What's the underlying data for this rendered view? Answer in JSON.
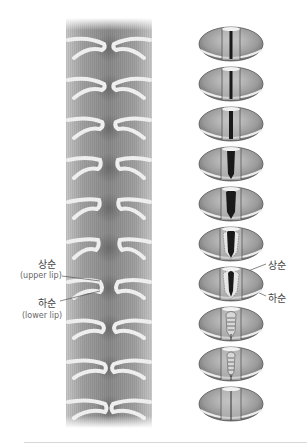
{
  "figure": {
    "title": "",
    "left_panel": {
      "description": "coronal cross-section sequence of vocal fold vibration",
      "frames": 10
    },
    "right_panel": {
      "description": "superior view sequence of glottal opening and closing",
      "frames": [
        {
          "index": 1,
          "state": "closed-slit"
        },
        {
          "index": 2,
          "state": "closed-slit"
        },
        {
          "index": 3,
          "state": "narrow-opening"
        },
        {
          "index": 4,
          "state": "opening"
        },
        {
          "index": 5,
          "state": "open"
        },
        {
          "index": 6,
          "state": "open-with-lower-lip-visible"
        },
        {
          "index": 7,
          "state": "open-with-lower-lip-visible"
        },
        {
          "index": 8,
          "state": "closing-lower-lip"
        },
        {
          "index": 9,
          "state": "closing-lower-lip"
        },
        {
          "index": 10,
          "state": "closed"
        }
      ]
    },
    "labels": {
      "left_upper_ko": "상순",
      "left_upper_en": "(upper lip)",
      "left_lower_ko": "하순",
      "left_lower_en": "(lower lip)",
      "right_upper_ko": "상순",
      "right_lower_ko": "하순"
    },
    "colors": {
      "tissue_gray": "#9a9a9a",
      "fold_highlight": "#eeeeee",
      "glottis_dark": "#1a1a1a",
      "leader_line": "#555555",
      "divider": "#d8d8d8"
    }
  }
}
